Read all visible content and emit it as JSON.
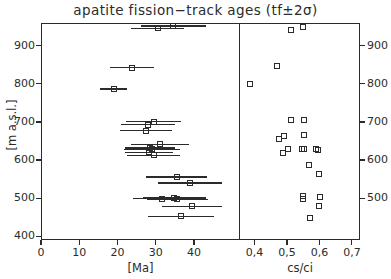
{
  "chart_data": {
    "type": "scatter",
    "title": "apatite fission−track ages (tf±2σ)",
    "panels": [
      {
        "name": "age-panel",
        "xlabel": "[Ma]",
        "ylabel": "[m a.s.l.]",
        "xlim": [
          0,
          52
        ],
        "ylim": [
          390,
          960
        ],
        "xticks": [
          0,
          10,
          20,
          30,
          40
        ],
        "xticklabels": [
          "0",
          "10",
          "20",
          "30",
          "40"
        ],
        "yticks": [
          400,
          500,
          600,
          700,
          800,
          900
        ],
        "yticklabels": [
          "400",
          "500",
          "600",
          "700",
          "800",
          "900"
        ],
        "grid": false,
        "errorbar": "tf±2σ",
        "points": [
          {
            "x": 30.5,
            "y": 946,
            "xerr": 7.0
          },
          {
            "x": 34.5,
            "y": 952,
            "xerr": 8.5
          },
          {
            "x": 23.8,
            "y": 843,
            "xerr": 5.8
          },
          {
            "x": 19.0,
            "y": 786,
            "xerr": 3.6
          },
          {
            "x": 29.5,
            "y": 701,
            "xerr": 7.2
          },
          {
            "x": 28.0,
            "y": 693,
            "xerr": 7.0
          },
          {
            "x": 27.5,
            "y": 677,
            "xerr": 6.8
          },
          {
            "x": 31.0,
            "y": 641,
            "xerr": 7.6
          },
          {
            "x": 28.5,
            "y": 632,
            "xerr": 6.6
          },
          {
            "x": 29.0,
            "y": 628,
            "xerr": 7.4
          },
          {
            "x": 28.2,
            "y": 620,
            "xerr": 6.2
          },
          {
            "x": 29.4,
            "y": 612,
            "xerr": 7.0
          },
          {
            "x": 35.5,
            "y": 556,
            "xerr": 8.0
          },
          {
            "x": 39.0,
            "y": 540,
            "xerr": 8.4
          },
          {
            "x": 31.5,
            "y": 499,
            "xerr": 7.5
          },
          {
            "x": 34.8,
            "y": 500,
            "xerr": 8.2
          },
          {
            "x": 35.6,
            "y": 497,
            "xerr": 8.0
          },
          {
            "x": 39.5,
            "y": 478,
            "xerr": 7.8
          },
          {
            "x": 36.5,
            "y": 452,
            "xerr": 8.6
          }
        ]
      },
      {
        "name": "ratio-panel",
        "xlabel": "cs/ci",
        "xlim": [
          0.355,
          0.725
        ],
        "ylim": [
          390,
          960
        ],
        "xticks": [
          0.4,
          0.5,
          0.6,
          0.7
        ],
        "xticklabels": [
          "0,4",
          "0,5",
          "0,6",
          "0,7"
        ],
        "yticks": [
          500,
          600,
          700,
          800,
          900
        ],
        "yticklabels": [
          "500",
          "600",
          "700",
          "800",
          "900"
        ],
        "grid": false,
        "points": [
          {
            "x": 0.513,
            "y": 942
          },
          {
            "x": 0.548,
            "y": 950
          },
          {
            "x": 0.468,
            "y": 847
          },
          {
            "x": 0.385,
            "y": 800
          },
          {
            "x": 0.512,
            "y": 704
          },
          {
            "x": 0.552,
            "y": 706
          },
          {
            "x": 0.476,
            "y": 655
          },
          {
            "x": 0.492,
            "y": 663
          },
          {
            "x": 0.552,
            "y": 667
          },
          {
            "x": 0.504,
            "y": 630
          },
          {
            "x": 0.487,
            "y": 618
          },
          {
            "x": 0.546,
            "y": 629
          },
          {
            "x": 0.553,
            "y": 628
          },
          {
            "x": 0.59,
            "y": 628
          },
          {
            "x": 0.596,
            "y": 626
          },
          {
            "x": 0.568,
            "y": 588
          },
          {
            "x": 0.6,
            "y": 563
          },
          {
            "x": 0.549,
            "y": 505
          },
          {
            "x": 0.549,
            "y": 497
          },
          {
            "x": 0.601,
            "y": 502
          },
          {
            "x": 0.598,
            "y": 479
          },
          {
            "x": 0.57,
            "y": 447
          }
        ]
      }
    ]
  }
}
